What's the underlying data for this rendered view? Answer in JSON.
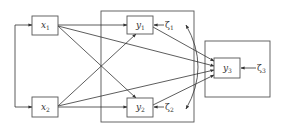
{
  "diagram": {
    "type": "path-diagram",
    "colors": {
      "stroke": "#333333",
      "background": "#ffffff"
    },
    "nodes": {
      "x1": {
        "label": "x",
        "sub": "1"
      },
      "x2": {
        "label": "x",
        "sub": "2"
      },
      "y1": {
        "label": "y",
        "sub": "1"
      },
      "y2": {
        "label": "y",
        "sub": "2"
      },
      "y3": {
        "label": "y",
        "sub": "3"
      }
    },
    "disturbances": {
      "zeta1": {
        "label": "ζ",
        "sub": "1"
      },
      "zeta2": {
        "label": "ζ",
        "sub": "2"
      },
      "zeta3": {
        "label": "ζ",
        "sub": "3"
      }
    },
    "edges": [
      {
        "from": "x1",
        "to": "y1"
      },
      {
        "from": "x1",
        "to": "y2"
      },
      {
        "from": "x1",
        "to": "y3"
      },
      {
        "from": "x2",
        "to": "y1"
      },
      {
        "from": "x2",
        "to": "y2"
      },
      {
        "from": "x2",
        "to": "y3"
      },
      {
        "from": "y1",
        "to": "y3"
      },
      {
        "from": "y2",
        "to": "y3"
      },
      {
        "from": "zeta1",
        "to": "y1"
      },
      {
        "from": "zeta2",
        "to": "y2"
      },
      {
        "from": "zeta3",
        "to": "y3"
      }
    ],
    "covariances": [
      {
        "between": [
          "x1",
          "x2"
        ]
      },
      {
        "between": [
          "zeta1",
          "zeta2"
        ]
      }
    ]
  }
}
